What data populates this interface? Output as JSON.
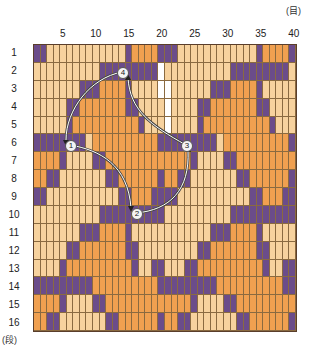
{
  "units": {
    "top": "(目)",
    "bottom": "(段)"
  },
  "columns": {
    "count": 40,
    "labels": [
      {
        "col": 5,
        "text": "5"
      },
      {
        "col": 10,
        "text": "10"
      },
      {
        "col": 15,
        "text": "15"
      },
      {
        "col": 20,
        "text": "20"
      },
      {
        "col": 25,
        "text": "25"
      },
      {
        "col": 30,
        "text": "30"
      },
      {
        "col": 35,
        "text": "35"
      },
      {
        "col": 40,
        "text": "40"
      }
    ]
  },
  "rows": {
    "count": 16,
    "labels": [
      "1",
      "2",
      "3",
      "4",
      "5",
      "6",
      "7",
      "8",
      "9",
      "10",
      "11",
      "12",
      "13",
      "14",
      "15",
      "16"
    ]
  },
  "colors": {
    "P": "#6b4c8a",
    "L": "#f7d29e",
    "O": "#f0a050",
    "W": "#ffffff"
  },
  "pattern": [
    "PPLLLLLLLLLLLLPOOOOPPPLLLLLLLLLLLLPOOOOP",
    "LLLLLLLLLLPPPPPPPPPWLLLLLLLLLLPPPPPPPPPL",
    "LLLLLLLPPPOOOOPLLLLWWLLLLLLPPPOOOOPLLLLL",
    "LLLLLPPOOOOOOOPPLLLLWLLLLPPOOOOOOOPPLLLL",
    "LLLLLPOOOOOOOOOOPLLLWLLLLPOOOOOOOOOOPLLL",
    "PPPPPPPPLOOOOOOOOOOPPPPPPPPPLOOOOOOOOOOP",
    "OOOOPLLLLPPOOOOOOOOOOOOOPLLLLPPOOOOOOOOO",
    "OOPPLLLLLLLPPOOOOOOPOOPPLLLLLLLPPOOOOOOP",
    "PPLLLLLLLLLLLPPOOOPPPPLLLLLLLLLLLPPOOOPP",
    "LLLLLLLLLLPPPPPPPPPPLLLLLLLLLLPPPPPPPPPP",
    "LLLLLLLPPPOOOOPLLLLLLLLLLLLPPPOOOOPLLLLL",
    "LLLLLPPOOOOOOOPPLLLLLLLLLPPOOOOOOOPPLLLL",
    "LLLLPOOOOOOOOOOPLLPPLLLPPOOOOOOOOOOPLLPP",
    "PPPPPPPPPOOOOOOOOOOPPPPPPPPPOOOOOOOOOOPP",
    "OOOOPLLLLPPOOOOOOOOOOOOOPLLLLPPOOOOOOOOO",
    "OOPPLLLLLLLPPOOOOOOPOOPPLLLLLLLPPOOOOOOP"
  ],
  "markers": [
    {
      "id": "1",
      "label": "1",
      "x": 70,
      "y": 145
    },
    {
      "id": "2",
      "label": "2",
      "x": 136,
      "y": 213
    },
    {
      "id": "3",
      "label": "3",
      "x": 186,
      "y": 145
    },
    {
      "id": "4",
      "label": "4",
      "x": 122,
      "y": 72
    }
  ]
}
